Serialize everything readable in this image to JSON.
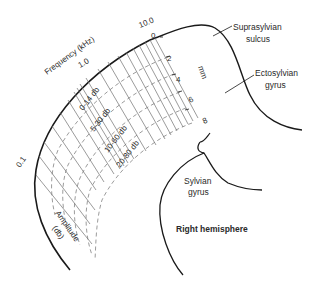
{
  "figure": {
    "frequency_axis": {
      "title": "Frequency (kHz)",
      "ticks": [
        "0.1",
        "1.0",
        "10.0"
      ]
    },
    "distance_axis": {
      "unit": "mm",
      "ticks": [
        "0",
        "2",
        "4",
        "6",
        "8"
      ]
    },
    "amplitude_axis": {
      "title": "Amplitude",
      "unit": "(db)",
      "bands": [
        "0-14 db",
        "5-30 db",
        "10-60 db",
        "20-80 db"
      ]
    },
    "anatomy_labels": {
      "suprasylvian": [
        "Suprasylvian",
        "sulcus"
      ],
      "ectosylvian": [
        "Ectosylvian",
        "gyrus"
      ],
      "sylvian": [
        "Sylvian",
        "gyrus"
      ],
      "hemisphere": "Right hemisphere"
    },
    "colors": {
      "outline": "#1a1a1a",
      "grid": "#707070",
      "text": "#2a2a2a"
    }
  }
}
